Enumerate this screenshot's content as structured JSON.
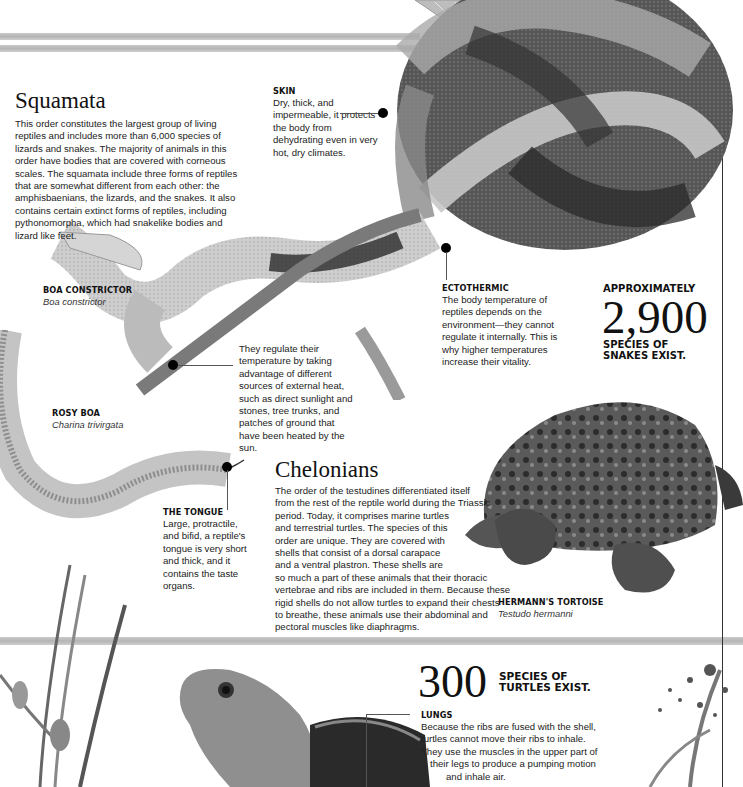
{
  "page": {
    "background": "#ffffff",
    "stripe_color": "#bdbdbd"
  },
  "squamata": {
    "title": "Squamata",
    "body": "This order constitutes the largest group of living reptiles and includes more than 6,000 species of lizards and snakes. The majority of animals in this order have bodies that are covered with corneous scales. The squamata include three forms of reptiles that are somewhat different from each other: the amphisbaenians, the lizards, and the snakes. It also contains certain extinct forms of reptiles, including pythonomorpha, which had snakelike bodies and lizard like feet."
  },
  "callouts": {
    "skin": {
      "label": "SKIN",
      "text": "Dry, thick, and impermeable, it protects the body from dehydrating even in very hot, dry climates."
    },
    "ectothermic": {
      "label": "ECTOTHERMIC",
      "text": "The body temperature of reptiles depends on the environment—they cannot regulate it internally. This is why higher temperatures increase their vitality."
    },
    "heat": {
      "text": "They regulate their temperature by taking advantage of different sources of external heat, such as direct sunlight and stones, tree trunks, and patches of ground that have been heated by the sun."
    },
    "tongue": {
      "label": "THE TONGUE",
      "text": "Large, protractile, and bifid, a reptile's tongue is very short and thick, and it contains the taste organs."
    },
    "lungs": {
      "label": "LUNGS",
      "lines": [
        "Because the ribs are fused with the shell,",
        "turtles cannot move their ribs to inhale.",
        "They use the muscles in the upper part of",
        "their legs to produce a pumping motion",
        "and inhale air."
      ]
    }
  },
  "species": {
    "boa": {
      "name": "BOA CONSTRICTOR",
      "scientific": "Boa constrictor"
    },
    "rosy_boa": {
      "name": "ROSY BOA",
      "scientific": "Charina trivirgata"
    },
    "tortoise": {
      "name": "HERMANN'S TORTOISE",
      "scientific": "Testudo hermanni"
    }
  },
  "snake_stat": {
    "prefix": "APPROXIMATELY",
    "number": "2,900",
    "suffix_line1": "SPECIES OF",
    "suffix_line2": "SNAKES EXIST."
  },
  "chelonians": {
    "title": "Chelonians",
    "lines": [
      "The order of the testudines differentiated itself",
      "from the rest of the reptile world during the Triassic",
      "period. Today, it comprises marine turtles",
      "and terrestrial turtles. The species of this",
      "order are unique. They are covered with",
      "shells that consist of a dorsal carapace",
      "and a ventral plastron. These shells are",
      "so much a part of these animals that their thoracic",
      "vertebrae and ribs are included in them. Because these",
      "rigid shells do not allow turtles to expand their chests",
      "to breathe, these animals use their abdominal and",
      "pectoral muscles like diaphragms."
    ]
  },
  "turtle_stat": {
    "number": "300",
    "suffix_line1": "SPECIES OF",
    "suffix_line2": "TURTLES EXIST."
  },
  "images": {
    "coiled_boa": "boa-constrictor-photo",
    "rosy_boa": "rosy-boa-photo",
    "tortoise": "hermanns-tortoise-photo",
    "turtle_head": "turtle-head-photo",
    "plants": "plant-stems-photo",
    "leaf": "leaf-photo"
  }
}
